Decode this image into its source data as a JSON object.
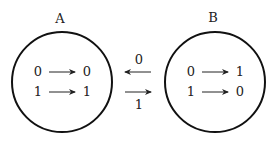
{
  "diagram": {
    "sets": [
      {
        "label": "A",
        "mappings": [
          {
            "from": "0",
            "to": "0"
          },
          {
            "from": "1",
            "to": "1"
          }
        ]
      },
      {
        "label": "B",
        "mappings": [
          {
            "from": "0",
            "to": "1"
          },
          {
            "from": "1",
            "to": "0"
          }
        ]
      }
    ],
    "transitions": [
      {
        "label": "0",
        "direction": "B-to-A"
      },
      {
        "label": "1",
        "direction": "A-to-B"
      }
    ]
  }
}
